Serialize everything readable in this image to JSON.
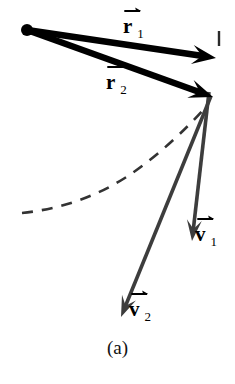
{
  "figure": {
    "caption": "(a)",
    "background_color": "#ffffff",
    "width": 235,
    "height": 384
  },
  "labels": {
    "r1": {
      "symbol": "r",
      "subscript": "1",
      "overhead": "vector-arrow"
    },
    "r2": {
      "symbol": "r",
      "subscript": "2",
      "overhead": "vector-arrow"
    },
    "v1": {
      "symbol": "v",
      "subscript": "1",
      "overhead": "vector-arrow"
    },
    "v2": {
      "symbol": "v",
      "subscript": "2",
      "overhead": "vector-arrow"
    }
  },
  "chart_data": {
    "type": "diagram",
    "title": "(a)",
    "origin": {
      "x": 27,
      "y": 30,
      "label": "origin-dot",
      "radius": 6,
      "color": "#000000"
    },
    "colors": {
      "position_vector": "#000000",
      "velocity_vector": "#3d3d3d",
      "trajectory": "#333333",
      "tick_mark": "#2b2b2b"
    },
    "vectors": [
      {
        "name": "r1",
        "kind": "position",
        "from": {
          "x": 27,
          "y": 30
        },
        "to": {
          "x": 216,
          "y": 58
        },
        "stroke_width": 6.5,
        "color": "#000000",
        "label_at": {
          "x": 123,
          "y": 16
        }
      },
      {
        "name": "r2",
        "kind": "position",
        "from": {
          "x": 27,
          "y": 30
        },
        "to": {
          "x": 213,
          "y": 97
        },
        "stroke_width": 6.5,
        "color": "#000000",
        "label_at": {
          "x": 106,
          "y": 72
        }
      },
      {
        "name": "v1",
        "kind": "velocity",
        "from": {
          "x": 209,
          "y": 92
        },
        "to": {
          "x": 192,
          "y": 241
        },
        "stroke_width": 3.6,
        "color": "#3d3d3d",
        "label_at": {
          "x": 195,
          "y": 224
        }
      },
      {
        "name": "v2",
        "kind": "velocity",
        "from": {
          "x": 211,
          "y": 96
        },
        "to": {
          "x": 121,
          "y": 317
        },
        "stroke_width": 3.6,
        "color": "#3d3d3d",
        "label_at": {
          "x": 129,
          "y": 299
        }
      }
    ],
    "trajectory": {
      "name": "dashed-trajectory",
      "style": "dashed",
      "dash_pattern": "11 9",
      "stroke_width": 2.6,
      "color": "#333333",
      "points": [
        {
          "x": 22,
          "y": 213
        },
        {
          "x": 70,
          "y": 204
        },
        {
          "x": 115,
          "y": 184
        },
        {
          "x": 155,
          "y": 155
        },
        {
          "x": 183,
          "y": 130
        },
        {
          "x": 203,
          "y": 110
        }
      ]
    },
    "tick_mark": {
      "name": "axis-tick",
      "from": {
        "x": 219,
        "y": 31
      },
      "to": {
        "x": 219,
        "y": 46
      },
      "stroke_width": 2.4,
      "color": "#2b2b2b"
    }
  }
}
